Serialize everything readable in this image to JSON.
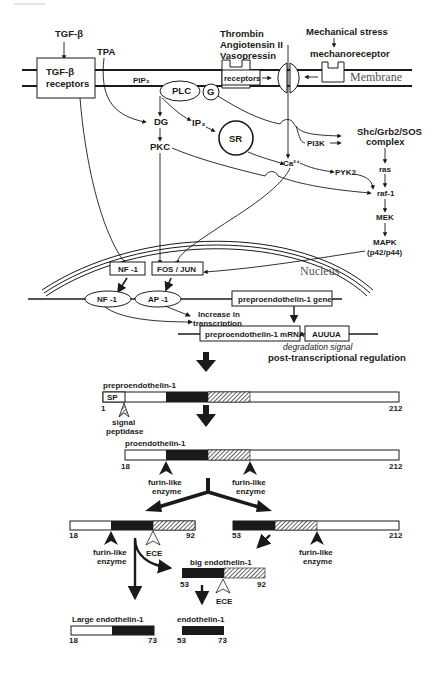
{
  "header": {
    "page_header": ""
  },
  "signaling": {
    "tgf_beta": "TGF-β",
    "tgf_receptor_line1": "TGF-β",
    "tgf_receptor_line2": "receptors",
    "tpa": "TPA",
    "pip2": "PIP₂",
    "plc": "PLC",
    "g": "G",
    "dg": "DG",
    "ip3": "IP₃",
    "sr": "SR",
    "pkc": "PKC",
    "ca": "Ca²⁺",
    "agonists": [
      "Thrombin",
      "Angiotensin II",
      "Vasopressin"
    ],
    "receptors": "receptors",
    "mechanical_stress": "Mechanical stress",
    "mechanoreceptor": "mechanoreceptor",
    "membrane": "Membrane",
    "pi3k": "PI3K",
    "shc_line1": "Shc/Grb2/SOS",
    "shc_line2": "complex",
    "pyk2": "PYK2",
    "ras": "ras",
    "raf": "raf-1",
    "mek": "MEK",
    "mapk_line1": "MAPK",
    "mapk_line2": "(p42/p44)"
  },
  "nucleus": {
    "label": "Nucleus",
    "nf1_box": "NF -1",
    "fosjun_box": "FOS / JUN",
    "nf1_oval": "NF -1",
    "ap1_oval": "AP -1",
    "gene": "preproendothelin-1 gene",
    "increase_line1": "Increase in",
    "increase_line2": "transcription",
    "mrna": "preproendothelin-1 mRNA",
    "auuua": "AUUUA",
    "degradation": "degradation signal",
    "post_transcriptional": "post-transcriptional regulation"
  },
  "processing": {
    "prepro_title": "preproendothelin-1",
    "sp": "SP",
    "prepro_start": "1",
    "prepro_end": "212",
    "signal_peptidase_line1": "signal",
    "signal_peptidase_line2": "peptidase",
    "pro_title": "proendothelin-1",
    "pro_start": "18",
    "pro_end": "212",
    "furin_line1": "furin-like",
    "furin_line2": "enzyme",
    "left_frag_start": "18",
    "left_frag_end": "92",
    "right_frag_start": "53",
    "right_frag_end": "212",
    "ece": "ECE",
    "big_title": "big endothelin-1",
    "big_start": "53",
    "big_end": "92",
    "large_title": "Large endothelin-1",
    "large_start": "18",
    "large_end": "73",
    "et1_title": "endothelin-1",
    "et1_start": "53",
    "et1_end": "73"
  }
}
